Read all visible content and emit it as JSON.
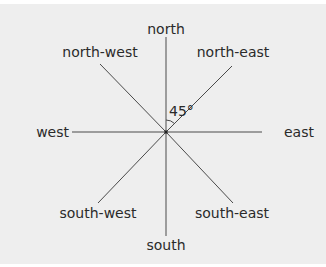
{
  "diagram": {
    "type": "compass-directions",
    "labels": {
      "north": "north",
      "north_east": "north-east",
      "east": "east",
      "south_east": "south-east",
      "south": "south",
      "south_west": "south-west",
      "west": "west",
      "north_west": "north-west"
    },
    "angle_label": "45°",
    "colors": {
      "background": "#eeeeee",
      "line": "#4a4a4a",
      "text": "#2a2a2a"
    }
  }
}
